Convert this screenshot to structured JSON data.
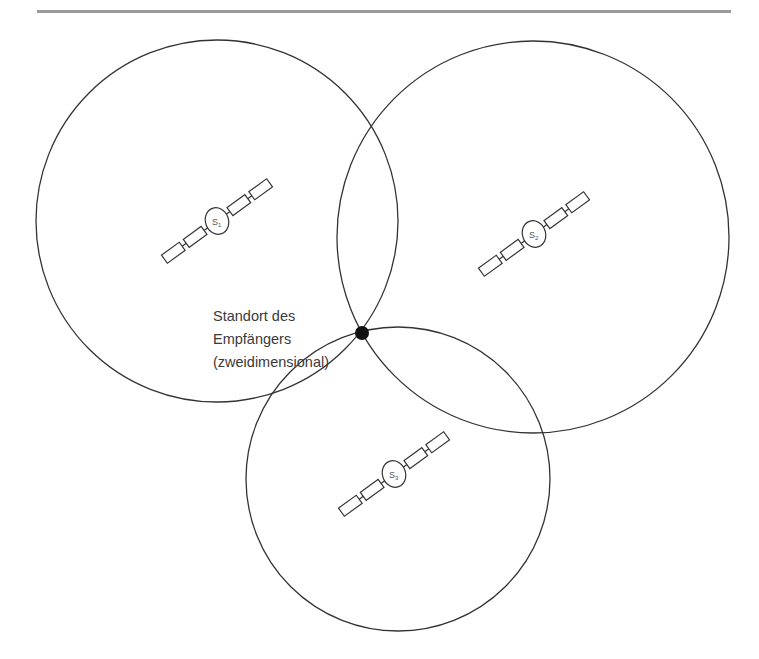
{
  "figure": {
    "rule_color": "#9a9a9a",
    "stroke_color": "#333333",
    "receiver_label": {
      "lines": [
        "Standort des",
        "Empfängers",
        "(zweidimensional)"
      ]
    },
    "satellites": [
      {
        "id": "S1",
        "label": "S",
        "subscript": "1",
        "cx": 217,
        "cy": 221,
        "range_radius": 181
      },
      {
        "id": "S2",
        "label": "S",
        "subscript": "2",
        "cx": 533,
        "cy": 236,
        "range_radius": 196
      },
      {
        "id": "S3",
        "label": "S",
        "subscript": "3",
        "cx": 397,
        "cy": 478,
        "range_radius": 152
      }
    ],
    "receiver_position": {
      "x": 362,
      "y": 333
    }
  }
}
